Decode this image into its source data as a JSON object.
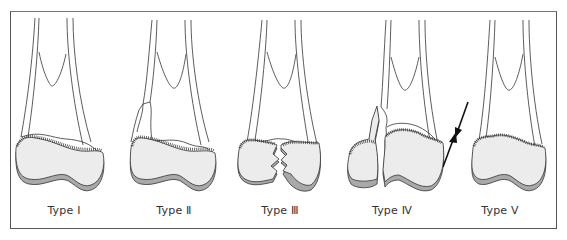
{
  "figure": {
    "panels": [
      {
        "id": "type-1",
        "label": "Type Ⅰ"
      },
      {
        "id": "type-2",
        "label": "Type Ⅱ"
      },
      {
        "id": "type-3",
        "label": "Type Ⅲ"
      },
      {
        "id": "type-4",
        "label": "Type Ⅳ"
      },
      {
        "id": "type-5",
        "label": "Type Ⅴ"
      }
    ],
    "colors": {
      "outline": "#333333",
      "epiphysis_fill": "#ececec",
      "cartilage_fill": "#a9a9a9",
      "frame": "#555555",
      "arrow": "#111111"
    }
  }
}
